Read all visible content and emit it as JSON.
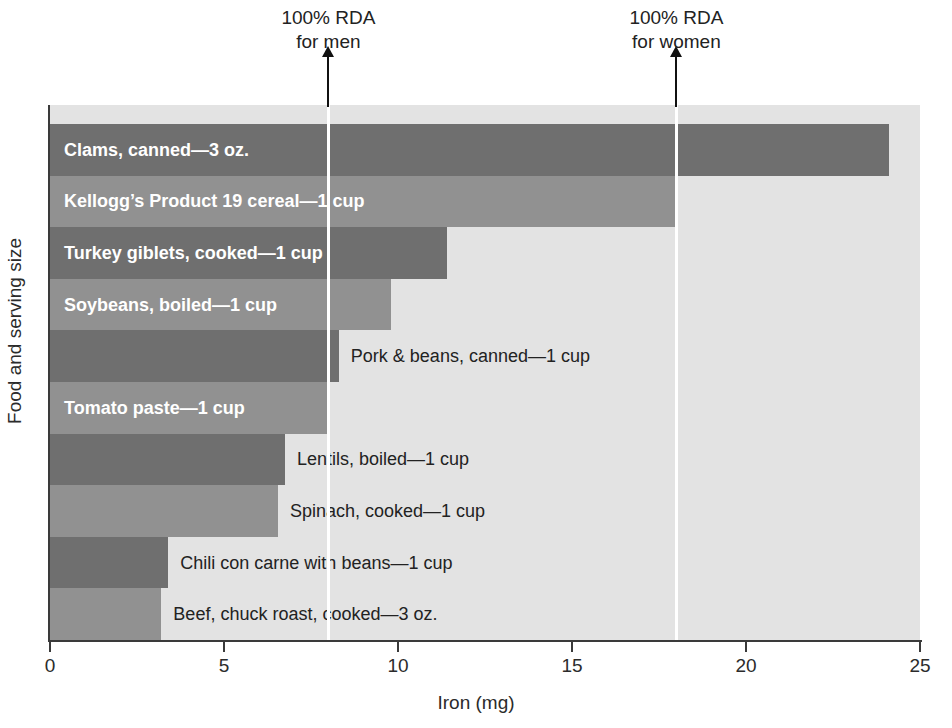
{
  "chart_data": {
    "type": "bar",
    "orientation": "horizontal",
    "title": "",
    "xlabel": "Iron (mg)",
    "ylabel": "Food and serving size",
    "xlim": [
      0,
      25
    ],
    "xticks": [
      "0",
      "5",
      "10",
      "15",
      "20",
      "25"
    ],
    "grid": false,
    "legend": "none",
    "categories": [
      "Clams, canned—3 oz.",
      "Kellogg’s Product 19 cereal—1 cup",
      "Turkey giblets, cooked—1 cup",
      "Soybeans, boiled—1 cup",
      "Pork & beans, canned—1 cup",
      "Tomato paste—1 cup",
      "Lentils, boiled—1 cup",
      "Spinach, cooked—1 cup",
      "Chili con carne with beans—1 cup",
      "Beef, chuck roast, cooked—3 oz."
    ],
    "values": [
      24.1,
      18.0,
      11.4,
      9.8,
      8.3,
      8.0,
      6.75,
      6.55,
      3.4,
      3.2
    ],
    "bars": [
      {
        "label": "Clams, canned—3 oz.",
        "value": 24.1,
        "shade": "dark",
        "label_position": "inside"
      },
      {
        "label": "Kellogg’s Product 19 cereal—1 cup",
        "value": 18.0,
        "shade": "light",
        "label_position": "inside"
      },
      {
        "label": "Turkey giblets, cooked—1 cup",
        "value": 11.4,
        "shade": "dark",
        "label_position": "inside"
      },
      {
        "label": "Soybeans, boiled—1 cup",
        "value": 9.8,
        "shade": "light",
        "label_position": "inside"
      },
      {
        "label": "Pork & beans, canned—1 cup",
        "value": 8.3,
        "shade": "dark",
        "label_position": "outside"
      },
      {
        "label": "Tomato paste—1 cup",
        "value": 8.0,
        "shade": "light",
        "label_position": "inside"
      },
      {
        "label": "Lentils, boiled—1 cup",
        "value": 6.75,
        "shade": "dark",
        "label_position": "outside"
      },
      {
        "label": "Spinach, cooked—1 cup",
        "value": 6.55,
        "shade": "light",
        "label_position": "outside"
      },
      {
        "label": "Chili con carne with beans—1 cup",
        "value": 3.4,
        "shade": "dark",
        "label_position": "outside"
      },
      {
        "label": "Beef, chuck roast, cooked—3 oz.",
        "value": 3.2,
        "shade": "light",
        "label_position": "outside"
      }
    ],
    "annotations": [
      {
        "name": "rda-men",
        "value": 8.0,
        "line1": "100% RDA",
        "line2": "for men"
      },
      {
        "name": "rda-women",
        "value": 18.0,
        "line1": "100% RDA",
        "line2": "for women"
      }
    ],
    "colors": {
      "bar_dark": "#6f6f6f",
      "bar_light": "#919191",
      "plot_background": "#e3e3e3",
      "page_background": "#ffffff",
      "axis": "#3a3a3a",
      "rda_line": "#ffffff",
      "arrow": "#111111",
      "inside_label_text": "#ffffff",
      "outside_label_text": "#222222"
    }
  }
}
